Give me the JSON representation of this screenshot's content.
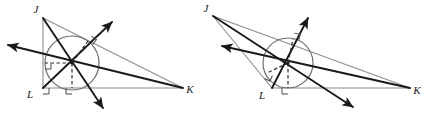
{
  "figure": {
    "colors": {
      "triangle_stroke": "#8c8c8c",
      "bisector_stroke": "#1a1a1a",
      "circle_stroke": "#6e6e6e",
      "dashed_stroke": "#2b2b2b",
      "right_angle_stroke": "#4a4a4a",
      "label_fill": "#1a1a1a",
      "background": "#ffffff"
    },
    "stroke_widths": {
      "triangle": 1.1,
      "bisector": 1.9,
      "circle": 1.2,
      "dashed": 1.2,
      "right_angle": 1.0
    },
    "dash_pattern": "3.5,2.5"
  },
  "diagrams": [
    {
      "id": "left-diagram",
      "name": "right-triangle-incircle",
      "vertices": {
        "J": {
          "x": 43,
          "y": 18,
          "label": "J",
          "label_x": 36,
          "label_y": 13
        },
        "K": {
          "x": 183,
          "y": 88,
          "label": "K",
          "label_x": 190,
          "label_y": 93
        },
        "L": {
          "x": 43,
          "y": 88,
          "label": "L",
          "label_x": 30,
          "label_y": 98
        }
      },
      "incircle": {
        "cx": 72,
        "cy": 63,
        "r": 27
      },
      "incenter": {
        "x": 72,
        "y": 63
      },
      "bisectors": [
        {
          "name": "bisector-from-J",
          "x1": 43,
          "y1": 18,
          "x2": 103,
          "y2": 108,
          "arrow_at": "end"
        },
        {
          "name": "bisector-from-K",
          "x1": 183,
          "y1": 88,
          "x2": 8,
          "y2": 45,
          "arrow_at": "end"
        },
        {
          "name": "bisector-from-L",
          "x1": 43,
          "y1": 88,
          "x2": 112,
          "y2": 22,
          "arrow_at": "end"
        }
      ],
      "radii": [
        {
          "name": "radius-to-side-JK",
          "x1": 72,
          "y1": 63,
          "x2": 88,
          "y2": 41
        },
        {
          "name": "radius-to-side-JL",
          "x1": 72,
          "y1": 63,
          "x2": 45,
          "y2": 63
        },
        {
          "name": "radius-to-side-LK",
          "x1": 72,
          "y1": 63,
          "x2": 72,
          "y2": 88
        }
      ],
      "right_angle_marks": [
        {
          "name": "right-angle-at-JK-tangent",
          "x": 88,
          "y": 41,
          "rotation": -54
        },
        {
          "name": "right-angle-at-JL-tangent",
          "x": 45,
          "y": 63,
          "rotation": 0
        },
        {
          "name": "right-angle-at-LK-tangent",
          "x": 72,
          "y": 88,
          "rotation": 90
        },
        {
          "name": "right-angle-at-vertex-L",
          "x": 43,
          "y": 88,
          "rotation": 0
        }
      ]
    },
    {
      "id": "right-diagram",
      "name": "obtuse-triangle-incircle",
      "vertices": {
        "J": {
          "x": 213,
          "y": 16,
          "label": "J",
          "label_x": 206,
          "label_y": 12
        },
        "K": {
          "x": 410,
          "y": 88,
          "label": "K",
          "label_x": 417,
          "label_y": 94
        },
        "L": {
          "x": 272,
          "y": 88,
          "label": "L",
          "label_x": 262,
          "label_y": 99
        }
      },
      "incircle": {
        "cx": 288,
        "cy": 63,
        "r": 25
      },
      "incenter": {
        "x": 288,
        "y": 63
      },
      "bisectors": [
        {
          "name": "bisector-from-J",
          "x1": 213,
          "y1": 16,
          "x2": 353,
          "y2": 107,
          "arrow_at": "end"
        },
        {
          "name": "bisector-from-K",
          "x1": 410,
          "y1": 88,
          "x2": 222,
          "y2": 46,
          "arrow_at": "end"
        },
        {
          "name": "bisector-from-L",
          "x1": 272,
          "y1": 88,
          "x2": 308,
          "y2": 18,
          "arrow_at": "end"
        }
      ],
      "radii": [
        {
          "name": "radius-to-side-JK",
          "x1": 288,
          "y1": 63,
          "x2": 293,
          "y2": 39
        },
        {
          "name": "radius-to-side-JL",
          "x1": 288,
          "y1": 63,
          "x2": 267,
          "y2": 73
        },
        {
          "name": "radius-to-side-LK",
          "x1": 288,
          "y1": 63,
          "x2": 288,
          "y2": 88
        }
      ],
      "right_angle_marks": [
        {
          "name": "right-angle-at-JK-tangent",
          "x": 293,
          "y": 39,
          "rotation": -78
        },
        {
          "name": "right-angle-at-JL-tangent",
          "x": 267,
          "y": 73,
          "rotation": 25
        },
        {
          "name": "right-angle-at-LK-tangent",
          "x": 288,
          "y": 88,
          "rotation": 90
        }
      ]
    }
  ]
}
